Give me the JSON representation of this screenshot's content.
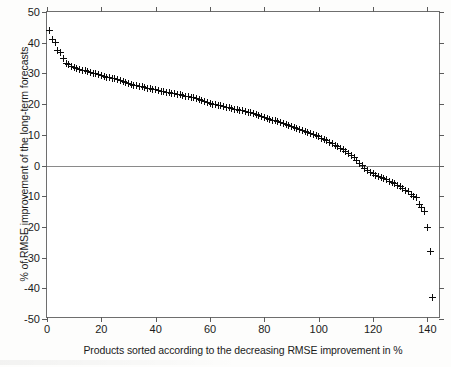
{
  "chart_data": {
    "type": "scatter",
    "title": "",
    "xlabel": "Products sorted according to the decreasing RMSE improvement in %",
    "ylabel": "% of RMSE improvement of the long-term forecasts",
    "xlim": [
      0,
      145
    ],
    "ylim": [
      -50,
      50
    ],
    "xticks": [
      0,
      20,
      40,
      60,
      80,
      100,
      120,
      140
    ],
    "yticks": [
      -50,
      -40,
      -30,
      -20,
      -10,
      0,
      10,
      20,
      30,
      40,
      50
    ],
    "grid": false,
    "legend": null,
    "marker": "+",
    "marker_color": "#0c0c0c",
    "reference_lines": [
      {
        "axis": "y",
        "value": 0,
        "color": "#8a8a8a"
      }
    ],
    "series": [
      {
        "name": "RMSE improvement per product",
        "x": [
          1,
          2,
          3,
          4,
          5,
          6,
          7,
          8,
          9,
          10,
          11,
          12,
          13,
          14,
          15,
          16,
          17,
          18,
          19,
          20,
          21,
          22,
          23,
          24,
          25,
          26,
          27,
          28,
          29,
          30,
          31,
          32,
          33,
          34,
          35,
          36,
          37,
          38,
          39,
          40,
          41,
          42,
          43,
          44,
          45,
          46,
          47,
          48,
          49,
          50,
          51,
          52,
          53,
          54,
          55,
          56,
          57,
          58,
          59,
          60,
          61,
          62,
          63,
          64,
          65,
          66,
          67,
          68,
          69,
          70,
          71,
          72,
          73,
          74,
          75,
          76,
          77,
          78,
          79,
          80,
          81,
          82,
          83,
          84,
          85,
          86,
          87,
          88,
          89,
          90,
          91,
          92,
          93,
          94,
          95,
          96,
          97,
          98,
          99,
          100,
          101,
          102,
          103,
          104,
          105,
          106,
          107,
          108,
          109,
          110,
          111,
          112,
          113,
          114,
          115,
          116,
          117,
          118,
          119,
          120,
          121,
          122,
          123,
          124,
          125,
          126,
          127,
          128,
          129,
          130,
          131,
          132,
          133,
          134,
          135,
          136,
          137,
          138,
          139,
          140,
          141,
          142
        ],
        "y": [
          44.0,
          41.0,
          40.2,
          37.5,
          36.8,
          34.8,
          33.2,
          32.8,
          32.4,
          32.0,
          31.7,
          31.4,
          31.1,
          30.8,
          30.6,
          30.4,
          30.1,
          29.9,
          29.6,
          29.3,
          29.0,
          28.8,
          28.6,
          28.4,
          28.2,
          27.9,
          27.6,
          27.3,
          27.0,
          26.7,
          26.4,
          26.2,
          26.0,
          25.8,
          25.6,
          25.4,
          25.2,
          25.0,
          24.8,
          24.6,
          24.4,
          24.2,
          24.0,
          23.9,
          23.8,
          23.6,
          23.4,
          23.2,
          23.0,
          22.8,
          22.6,
          22.4,
          22.2,
          22.0,
          21.8,
          21.5,
          21.2,
          20.9,
          20.6,
          20.3,
          20.0,
          19.8,
          19.6,
          19.4,
          19.2,
          19.0,
          18.8,
          18.6,
          18.4,
          18.2,
          18.0,
          17.8,
          17.6,
          17.4,
          17.2,
          17.0,
          16.7,
          16.4,
          16.0,
          15.7,
          15.4,
          15.1,
          14.8,
          14.5,
          14.2,
          13.9,
          13.6,
          13.3,
          13.0,
          12.7,
          12.4,
          12.1,
          11.8,
          11.5,
          11.2,
          10.9,
          10.5,
          10.1,
          9.7,
          9.3,
          8.9,
          8.5,
          8.1,
          7.6,
          7.1,
          6.6,
          6.1,
          5.6,
          5.1,
          4.6,
          4.0,
          3.3,
          2.5,
          1.7,
          0.8,
          -0.1,
          -0.9,
          -1.6,
          -2.2,
          -2.7,
          -3.1,
          -3.5,
          -3.9,
          -4.3,
          -4.7,
          -5.1,
          -5.5,
          -5.9,
          -6.4,
          -6.9,
          -7.4,
          -8.0,
          -8.6,
          -9.3,
          -10.0,
          -10.3,
          -12.8,
          -13.6,
          -15.0,
          -20.2,
          -27.9,
          -43.0
        ]
      }
    ]
  },
  "axes": {
    "x_tick_labels": [
      "0",
      "20",
      "40",
      "60",
      "80",
      "100",
      "120",
      "140"
    ],
    "y_tick_labels": [
      "50",
      "40",
      "30",
      "20",
      "10",
      "0",
      "-10",
      "-20",
      "-30",
      "-40",
      "-50"
    ]
  }
}
